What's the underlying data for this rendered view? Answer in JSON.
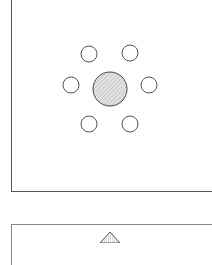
{
  "figure": {
    "type": "patent-style line drawing",
    "top_panel": {
      "center_disc": {
        "cx": 110,
        "cy": 89,
        "r": 17,
        "fill": "#d8d8d8",
        "stroke": "#444444"
      },
      "ring_circles": [
        {
          "cx": 89,
          "cy": 54,
          "r": 8
        },
        {
          "cx": 130,
          "cy": 53,
          "r": 8
        },
        {
          "cx": 71,
          "cy": 85,
          "r": 8
        },
        {
          "cx": 149,
          "cy": 85,
          "r": 8
        },
        {
          "cx": 89,
          "cy": 124,
          "r": 8
        },
        {
          "cx": 130,
          "cy": 124,
          "r": 8
        }
      ]
    },
    "bottom_panel": {
      "triangle": {
        "apex_x": 110,
        "apex_y": 232,
        "base_y": 243,
        "half_width": 10,
        "fill": "#bbbbbb"
      }
    },
    "colors": {
      "line": "#555555",
      "background": "#ffffff"
    }
  }
}
